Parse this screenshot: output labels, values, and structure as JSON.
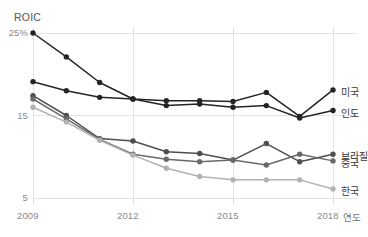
{
  "chart_data": {
    "type": "line",
    "title": "",
    "ylabel": "ROIC",
    "xlabel": "연도",
    "x": [
      2009,
      2010,
      2011,
      2012,
      2013,
      2014,
      2015,
      2016,
      2017,
      2018
    ],
    "xticks": [
      "2009",
      "2012",
      "2015",
      "2018"
    ],
    "yticks": [
      "25%",
      "15",
      "5"
    ],
    "ytick_values": [
      25,
      15,
      5
    ],
    "ylim": [
      3,
      25.8
    ],
    "xlim": [
      2009,
      2018
    ],
    "grid": true,
    "legend_position": "right-inline",
    "series": [
      {
        "name": "미국",
        "color": "#242424",
        "values": [
          25.0,
          22.1,
          19.0,
          17.0,
          16.8,
          16.8,
          16.7,
          17.8,
          14.9,
          18.1
        ]
      },
      {
        "name": "인도",
        "color": "#242424",
        "values": [
          19.1,
          18.0,
          17.2,
          17.0,
          16.2,
          16.4,
          16.0,
          16.2,
          14.7,
          15.6
        ]
      },
      {
        "name": "브라질",
        "color": "#4f4f4f",
        "values": [
          17.4,
          15.0,
          12.2,
          11.9,
          10.6,
          10.4,
          9.6,
          11.6,
          9.4,
          10.3
        ]
      },
      {
        "name": "중국",
        "color": "#6a6a6a",
        "values": [
          17.0,
          14.6,
          12.1,
          10.3,
          9.7,
          9.4,
          9.6,
          9.0,
          10.3,
          9.5
        ]
      },
      {
        "name": "한국",
        "color": "#b2b2b2",
        "values": [
          16.0,
          14.2,
          12.0,
          10.2,
          8.6,
          7.6,
          7.2,
          7.2,
          7.2,
          6.1
        ]
      }
    ]
  },
  "axis": {
    "y_title": "ROIC",
    "x_unit": "연도",
    "yticks": [
      {
        "label": "25%",
        "value": 25
      },
      {
        "label": "15",
        "value": 15
      },
      {
        "label": "5",
        "value": 5
      }
    ],
    "xticks": [
      {
        "label": "2009",
        "value": 2009
      },
      {
        "label": "2012",
        "value": 2012
      },
      {
        "label": "2015",
        "value": 2015
      },
      {
        "label": "2018",
        "value": 2018
      }
    ]
  },
  "legend": [
    {
      "label": "미국"
    },
    {
      "label": "인도"
    },
    {
      "label": "브라질"
    },
    {
      "label": "중국"
    },
    {
      "label": "한국"
    }
  ],
  "colors": {
    "grid": "#e3e3e3",
    "axis": "#d8d8d8",
    "tick_text": "#8a8a8a",
    "background": "#ffffff"
  }
}
